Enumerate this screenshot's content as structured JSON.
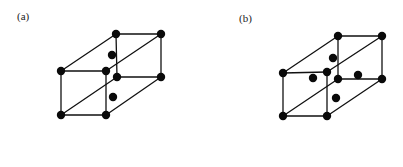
{
  "figure": {
    "panels": [
      {
        "id": "a",
        "label": "(a)",
        "description": "Rectangular prism lattice cell with 8 corner atoms and 2 interior face-centered atoms",
        "vertices": {
          "front_top_left": [
            61,
            71
          ],
          "front_top_right": [
            106,
            71
          ],
          "front_bottom_left": [
            61,
            115
          ],
          "front_bottom_right": [
            106,
            115
          ],
          "back_top_left": [
            116,
            34
          ],
          "back_top_right": [
            161,
            34
          ],
          "back_bottom_left": [
            117,
            77
          ],
          "back_bottom_right": [
            161,
            77
          ]
        },
        "edges": [
          [
            "front_top_left",
            "front_top_right"
          ],
          [
            "front_top_right",
            "front_bottom_right"
          ],
          [
            "front_bottom_right",
            "front_bottom_left"
          ],
          [
            "front_bottom_left",
            "front_top_left"
          ],
          [
            "back_top_left",
            "back_top_right"
          ],
          [
            "back_top_right",
            "back_bottom_right"
          ],
          [
            "back_bottom_right",
            "back_bottom_left"
          ],
          [
            "back_bottom_left",
            "back_top_left"
          ],
          [
            "front_top_left",
            "back_top_left"
          ],
          [
            "front_top_right",
            "back_top_right"
          ],
          [
            "front_bottom_left",
            "back_bottom_left"
          ],
          [
            "front_bottom_right",
            "back_bottom_right"
          ]
        ],
        "corner_atoms": 8,
        "extra_atoms": [
          [
            112,
            55
          ],
          [
            113,
            97
          ]
        ]
      },
      {
        "id": "b",
        "label": "(b)",
        "description": "Rectangular prism lattice cell with 8 corner atoms and 4 interior face-centered atoms",
        "vertices": {
          "front_top_left": [
            283,
            73
          ],
          "front_top_right": [
            327,
            72
          ],
          "front_bottom_left": [
            283,
            116
          ],
          "front_bottom_right": [
            327,
            116
          ],
          "back_top_left": [
            338,
            36
          ],
          "back_top_right": [
            382,
            36
          ],
          "back_bottom_left": [
            338,
            79
          ],
          "back_bottom_right": [
            382,
            79
          ]
        },
        "edges": [
          [
            "front_top_left",
            "front_top_right"
          ],
          [
            "front_top_right",
            "front_bottom_right"
          ],
          [
            "front_bottom_right",
            "front_bottom_left"
          ],
          [
            "front_bottom_left",
            "front_top_left"
          ],
          [
            "back_top_left",
            "back_top_right"
          ],
          [
            "back_top_right",
            "back_bottom_right"
          ],
          [
            "back_bottom_right",
            "back_bottom_left"
          ],
          [
            "back_bottom_left",
            "back_top_left"
          ],
          [
            "front_top_left",
            "back_top_left"
          ],
          [
            "front_top_right",
            "back_top_right"
          ],
          [
            "front_bottom_left",
            "back_bottom_left"
          ],
          [
            "front_bottom_right",
            "back_bottom_right"
          ]
        ],
        "corner_atoms": 8,
        "extra_atoms": [
          [
            333,
            58
          ],
          [
            313,
            78
          ],
          [
            358,
            75
          ],
          [
            336,
            98
          ]
        ]
      }
    ],
    "style": {
      "line_color": "#111111",
      "atom_color": "#0a0a0a",
      "background": "#ffffff",
      "atom_radius": 4.2
    }
  }
}
